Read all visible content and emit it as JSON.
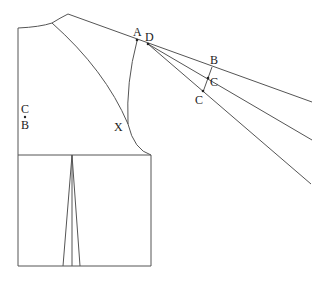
{
  "diagram": {
    "type": "garment pattern draft (raglan sleeve bodice)",
    "labels": {
      "A": "A",
      "D": "D",
      "B_right": "B",
      "C_mid": "C",
      "C_low": "C",
      "X": "X",
      "C_left": "C",
      "B_left": "B"
    },
    "colors": {
      "line": "#555555",
      "background": "#ffffff",
      "text": "#222222"
    }
  }
}
